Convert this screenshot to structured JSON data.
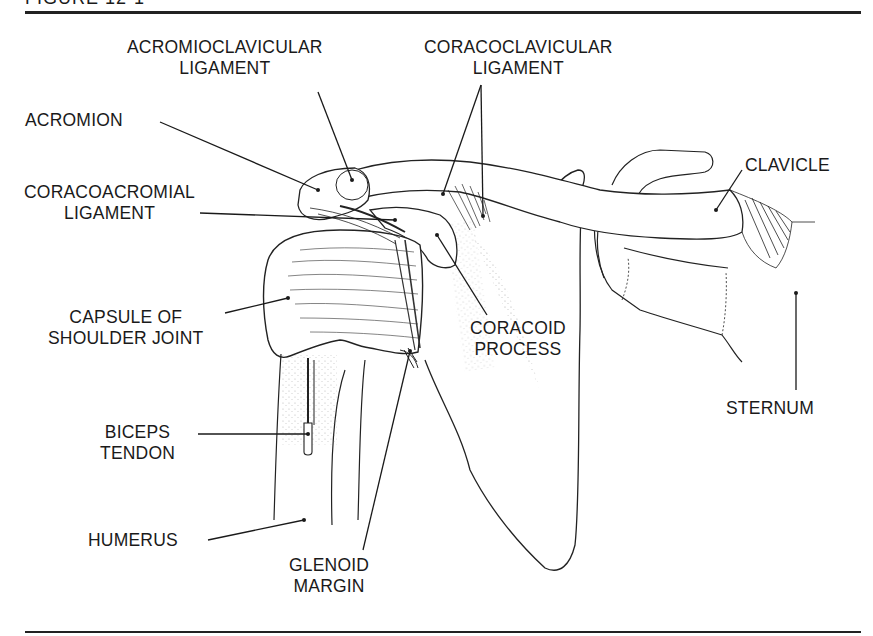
{
  "figure": {
    "header": "FIGURE 12-1"
  },
  "labels": {
    "acromioclavicular_ligament": [
      "ACROMIOCLAVICULAR",
      "LIGAMENT"
    ],
    "coracoclavicular_ligament": [
      "CORACOCLAVICULAR",
      "LIGAMENT"
    ],
    "acromion": [
      "ACROMION"
    ],
    "clavicle": [
      "CLAVICLE"
    ],
    "coracoacromial_ligament": [
      "CORACOACROMIAL",
      "LIGAMENT"
    ],
    "capsule_of_shoulder_joint": [
      "CAPSULE OF",
      "SHOULDER JOINT"
    ],
    "coracoid_process": [
      "CORACOID",
      "PROCESS"
    ],
    "biceps_tendon": [
      "BICEPS",
      "TENDON"
    ],
    "sternum": [
      "STERNUM"
    ],
    "humerus": [
      "HUMERUS"
    ],
    "glenoid_margin": [
      "GLENOID",
      "MARGIN"
    ]
  },
  "colors": {
    "ink": "#1a1a1a",
    "background": "#ffffff"
  }
}
